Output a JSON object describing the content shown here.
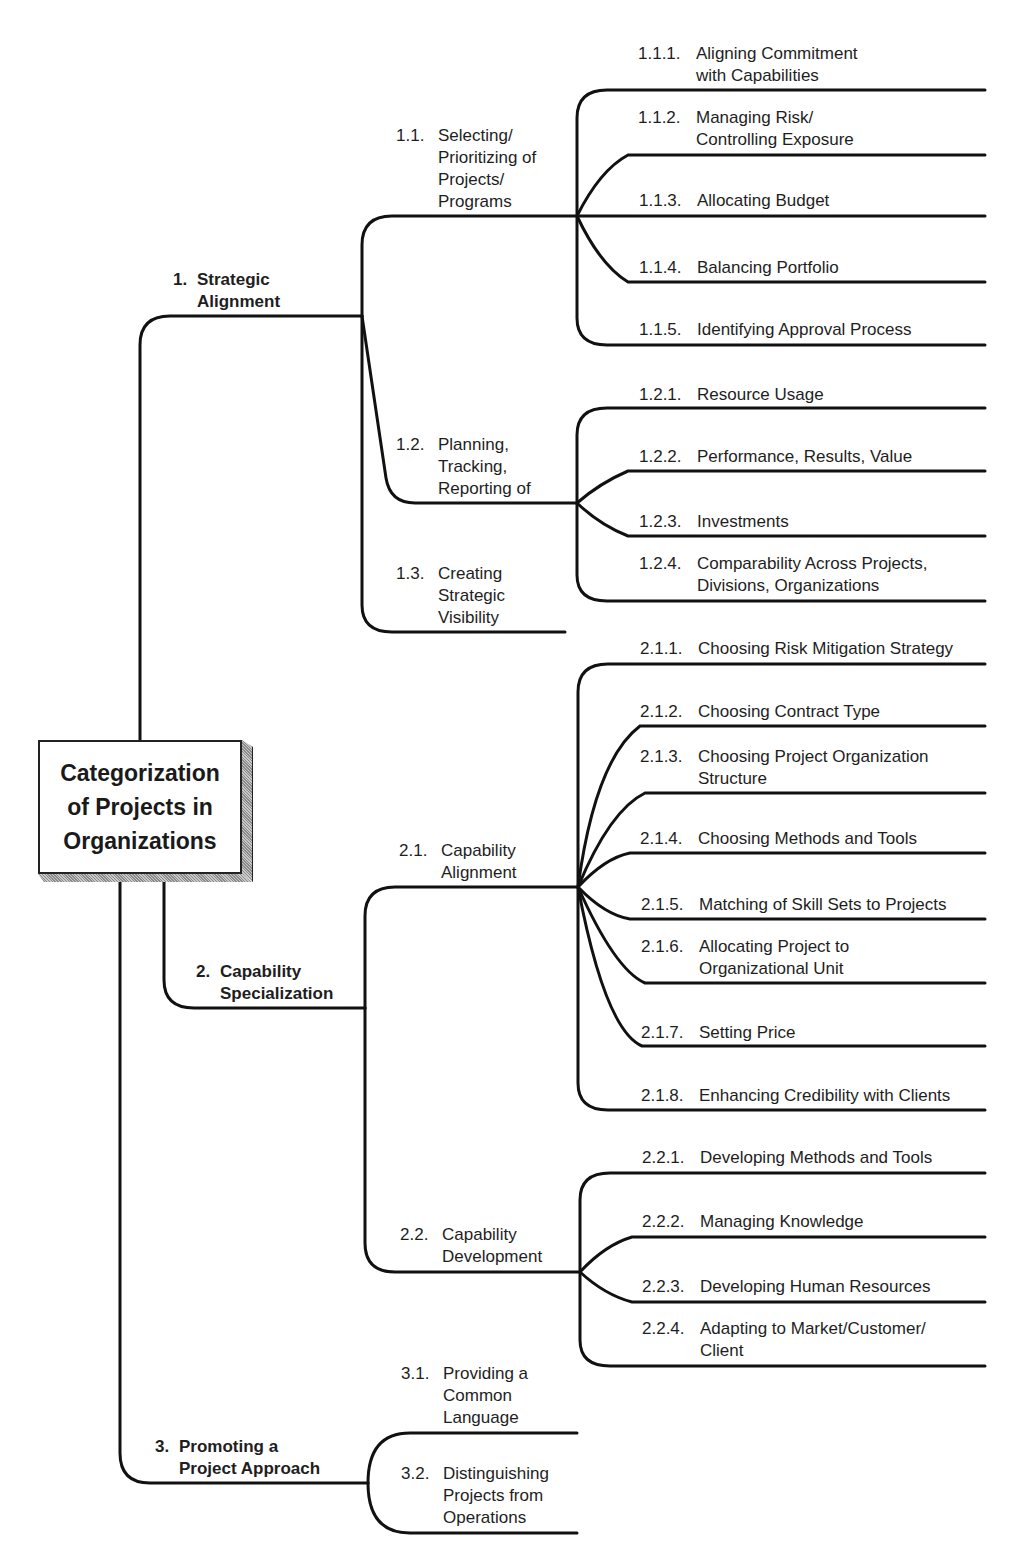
{
  "root": {
    "title": "Categorization\nof Projects in\nOrganizations"
  },
  "colors": {
    "line": "#111111",
    "text": "#1e1e1e",
    "box_shadow": "#9a9a9a"
  },
  "branches": [
    {
      "num": "1.",
      "label": "Strategic\nAlignment",
      "children": [
        {
          "num": "1.1.",
          "label": "Selecting/\nPrioritizing of\nProjects/\nPrograms",
          "children": [
            {
              "num": "1.1.1.",
              "label": "Aligning Commitment\nwith Capabilities"
            },
            {
              "num": "1.1.2.",
              "label": "Managing Risk/\nControlling Exposure"
            },
            {
              "num": "1.1.3.",
              "label": "Allocating Budget"
            },
            {
              "num": "1.1.4.",
              "label": "Balancing Portfolio"
            },
            {
              "num": "1.1.5.",
              "label": "Identifying Approval Process"
            }
          ]
        },
        {
          "num": "1.2.",
          "label": "Planning,\nTracking,\nReporting of",
          "children": [
            {
              "num": "1.2.1.",
              "label": "Resource Usage"
            },
            {
              "num": "1.2.2.",
              "label": "Performance, Results, Value"
            },
            {
              "num": "1.2.3.",
              "label": "Investments"
            },
            {
              "num": "1.2.4.",
              "label": "Comparability Across Projects,\nDivisions, Organizations"
            }
          ]
        },
        {
          "num": "1.3.",
          "label": "Creating\nStrategic\nVisibility",
          "children": []
        }
      ]
    },
    {
      "num": "2.",
      "label": "Capability\nSpecialization",
      "children": [
        {
          "num": "2.1.",
          "label": "Capability\nAlignment",
          "children": [
            {
              "num": "2.1.1.",
              "label": "Choosing Risk Mitigation Strategy"
            },
            {
              "num": "2.1.2.",
              "label": "Choosing Contract Type"
            },
            {
              "num": "2.1.3.",
              "label": "Choosing Project Organization\nStructure"
            },
            {
              "num": "2.1.4.",
              "label": "Choosing Methods and Tools"
            },
            {
              "num": "2.1.5.",
              "label": "Matching of Skill Sets to Projects"
            },
            {
              "num": "2.1.6.",
              "label": "Allocating Project to\nOrganizational Unit"
            },
            {
              "num": "2.1.7.",
              "label": "Setting Price"
            },
            {
              "num": "2.1.8.",
              "label": "Enhancing Credibility with Clients"
            }
          ]
        },
        {
          "num": "2.2.",
          "label": "Capability\nDevelopment",
          "children": [
            {
              "num": "2.2.1.",
              "label": "Developing Methods and Tools"
            },
            {
              "num": "2.2.2.",
              "label": "Managing Knowledge"
            },
            {
              "num": "2.2.3.",
              "label": "Developing Human Resources"
            },
            {
              "num": "2.2.4.",
              "label": "Adapting to Market/Customer/\nClient"
            }
          ]
        }
      ]
    },
    {
      "num": "3.",
      "label": "Promoting a\nProject Approach",
      "children": [
        {
          "num": "3.1.",
          "label": "Providing a\nCommon\nLanguage",
          "children": []
        },
        {
          "num": "3.2.",
          "label": "Distinguishing\nProjects from\nOperations",
          "children": []
        }
      ]
    }
  ]
}
